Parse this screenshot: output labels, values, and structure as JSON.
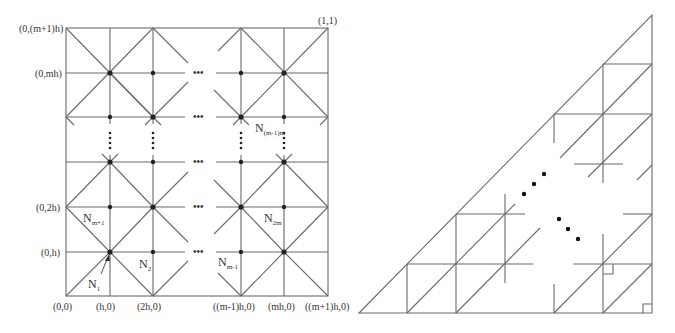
{
  "left_figure": {
    "name": "square-mesh",
    "corner_label": "(1,1)",
    "y_axis_labels": [
      "(0,(m+1)h)",
      "(0,mh)",
      "(0,2h)",
      "(0,h)"
    ],
    "x_axis_labels": [
      "(0,0)",
      "(h,0)",
      "(2h,0)",
      "((m-1)h,0)",
      "(mh,0)",
      "((m+1)h,0)"
    ],
    "ellipsis_h": "•••",
    "ellipsis_v": "⋮",
    "node_labels": {
      "n1": {
        "base": "N",
        "sub": "1"
      },
      "n2": {
        "base": "N",
        "sub": "2"
      },
      "nm1": {
        "base": "N",
        "sub": "m+1"
      },
      "n2m": {
        "base": "N",
        "sub": "2m"
      },
      "nmminus1": {
        "base": "N",
        "sub": "m-1"
      },
      "nm1m": {
        "base": "N",
        "sub": "(m-1)m"
      }
    }
  },
  "right_figure": {
    "name": "triangular-mesh"
  },
  "colors": {
    "line": "#6a6a6a",
    "node": "#222222",
    "text": "#333333",
    "background": "#ffffff"
  }
}
